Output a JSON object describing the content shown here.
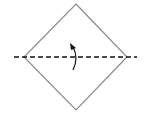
{
  "diagram": {
    "type": "origami-fold-step",
    "colors": {
      "background": "#ffffff",
      "outline": "#8a8a8a",
      "fold_line": "#111111",
      "arrow": "#111111"
    },
    "shape": {
      "kind": "diamond",
      "points": [
        [
          76,
          4
        ],
        [
          127,
          57
        ],
        [
          76,
          110
        ],
        [
          24,
          57
        ]
      ]
    },
    "fold_line": {
      "style": "dashed",
      "x1": 14,
      "y1": 57,
      "x2": 137,
      "y2": 57
    },
    "arrow": {
      "direction": "up",
      "meaning": "fold bottom half up"
    }
  }
}
